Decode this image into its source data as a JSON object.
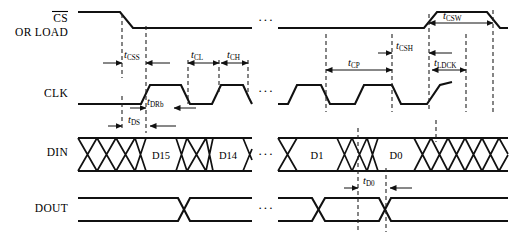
{
  "figure": {
    "type": "timing-diagram",
    "width": 511,
    "height": 238,
    "background": "#ffffff",
    "line_color": "#111111"
  },
  "signals": [
    {
      "id": "cs",
      "name_main": "CS",
      "name_overbar": true,
      "name_second": "OR LOAD",
      "row_y": 22
    },
    {
      "id": "clk",
      "name_main": "CLK",
      "name_overbar": false,
      "name_second": "",
      "row_y": 93
    },
    {
      "id": "din",
      "name_main": "DIN",
      "name_overbar": false,
      "name_second": "",
      "row_y": 152
    },
    {
      "id": "dout",
      "name_main": "DOUT",
      "name_overbar": false,
      "name_second": "",
      "row_y": 208
    }
  ],
  "timing_params": [
    {
      "id": "tcss",
      "base": "t",
      "sub": "CSS",
      "x": 131,
      "y": 55
    },
    {
      "id": "tcl",
      "base": "t",
      "sub": "CL",
      "x": 197,
      "y": 55
    },
    {
      "id": "tch",
      "base": "t",
      "sub": "CH",
      "x": 238,
      "y": 55
    },
    {
      "id": "tdrb",
      "base": "t",
      "sub": "DRb",
      "x": 155,
      "y": 100
    },
    {
      "id": "tds",
      "base": "t",
      "sub": "DS",
      "x": 140,
      "y": 119
    },
    {
      "id": "tcsw",
      "base": "t",
      "sub": "CSW",
      "x": 452,
      "y": 17
    },
    {
      "id": "tcsh",
      "base": "t",
      "sub": "CSH",
      "x": 412,
      "y": 47
    },
    {
      "id": "tcp",
      "base": "t",
      "sub": "CP",
      "x": 363,
      "y": 62
    },
    {
      "id": "tldck",
      "base": "t",
      "sub": "LDCK",
      "x": 460,
      "y": 62
    },
    {
      "id": "td0",
      "base": "t",
      "sub": "D0",
      "x": 371,
      "y": 180
    }
  ],
  "din_data_labels": [
    {
      "id": "d15",
      "text": "D15",
      "x": 158,
      "y": 156
    },
    {
      "id": "d14",
      "text": "D14",
      "x": 225,
      "y": 156
    },
    {
      "id": "d1",
      "text": "D1",
      "x": 318,
      "y": 156
    },
    {
      "id": "d0",
      "text": "D0",
      "x": 395,
      "y": 156
    }
  ],
  "ellipses": [
    {
      "id": "ellipsis-cs",
      "text": "···",
      "x": 264,
      "y": 24
    },
    {
      "id": "ellipsis-clk",
      "text": "···",
      "x": 264,
      "y": 95
    },
    {
      "id": "ellipsis-din",
      "text": "···",
      "x": 264,
      "y": 156
    },
    {
      "id": "ellipsis-dout",
      "text": "···",
      "x": 264,
      "y": 210
    }
  ]
}
